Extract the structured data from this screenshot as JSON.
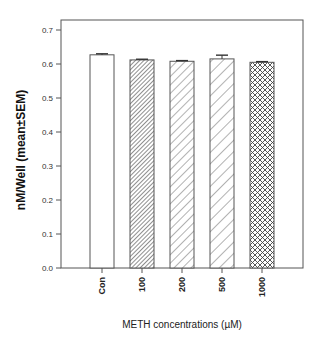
{
  "chart_data": {
    "type": "bar",
    "title": "",
    "xlabel": "METH concentrations (µM)",
    "ylabel": "nM/Well (mean±SEM)",
    "categories": [
      "Con",
      "100",
      "200",
      "500",
      "1000"
    ],
    "values": [
      0.627,
      0.612,
      0.608,
      0.615,
      0.605
    ],
    "errors": [
      0.003,
      0.002,
      0.002,
      0.011,
      0.002
    ],
    "patterns": [
      "none",
      "dense-diagonal",
      "wide-diagonal",
      "wider-diagonal",
      "crosshatch"
    ],
    "ylim": [
      0,
      0.7
    ],
    "yticks": [
      0.0,
      0.1,
      0.2,
      0.3,
      0.4,
      0.5,
      0.6,
      0.7
    ],
    "ytick_labels": [
      "0.0",
      "0.1",
      "0.2",
      "0.3",
      "0.4",
      "0.5",
      "0.6",
      "0.7"
    ],
    "grid": false,
    "legend": "none",
    "bar_color": "#ffffff",
    "edge_color": "#555555"
  }
}
